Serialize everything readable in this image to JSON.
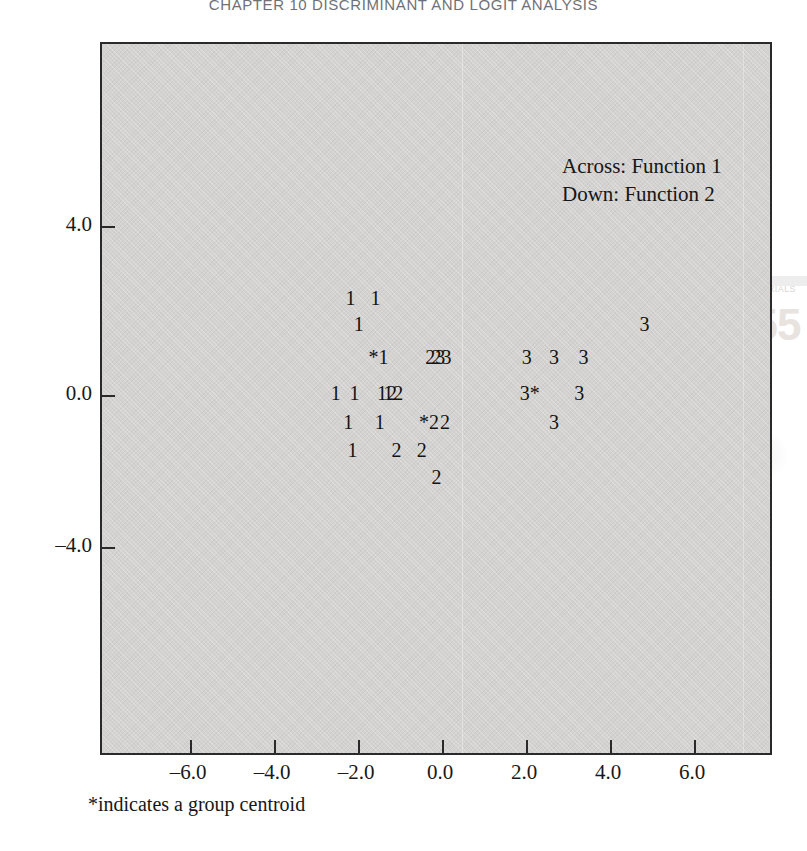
{
  "running_head": "CHAPTER 10     DISCRIMINANT AND LOGIT ANALYSIS",
  "ghost": {
    "word_a": "MATERIALS",
    "big": "255",
    "word_b": "chapter"
  },
  "legend": {
    "line1": "Across: Function 1",
    "line2": "Down: Function 2"
  },
  "footnote": "*indicates a group centroid",
  "axis": {
    "y_ticks": [
      "4.0",
      "0.0",
      "–4.0"
    ],
    "x_ticks": [
      "–6.0",
      "–4.0",
      "–2.0",
      "0.0",
      "2.0",
      "4.0",
      "6.0"
    ]
  },
  "chart_data": {
    "type": "scatter",
    "title": "",
    "subtitle": "",
    "xlabel": "Function 1",
    "ylabel": "Function 2",
    "xlim": [
      -7.6,
      7.6
    ],
    "ylim": [
      -7.0,
      9.0
    ],
    "grid": false,
    "legend_position": "inside-top-right",
    "annotations": [
      "Across: Function 1",
      "Down: Function 2",
      "*indicates a group centroid"
    ],
    "centroid_marker": "*",
    "series": [
      {
        "name": "Group 1",
        "marker": "1",
        "points": [
          {
            "label": "1",
            "x": -2.3,
            "y": 2.3
          },
          {
            "label": "1",
            "x": -1.7,
            "y": 2.3
          },
          {
            "label": "1",
            "x": -2.1,
            "y": 1.7
          },
          {
            "label": "*1",
            "x": -1.75,
            "y": 0.9
          },
          {
            "label": "1",
            "x": -2.65,
            "y": 0.05
          },
          {
            "label": "1",
            "x": -2.2,
            "y": 0.05
          },
          {
            "label": "12",
            "x": -1.55,
            "y": 0.05
          },
          {
            "label": "1",
            "x": -2.35,
            "y": -0.65
          },
          {
            "label": "1",
            "x": -1.6,
            "y": -0.65
          },
          {
            "label": "1",
            "x": -2.25,
            "y": -1.3
          }
        ]
      },
      {
        "name": "Group 2",
        "marker": "2",
        "points": [
          {
            "label": "23",
            "x": -0.4,
            "y": 0.9
          },
          {
            "label": "12",
            "x": -1.4,
            "y": 0.05
          },
          {
            "label": "*2",
            "x": -0.55,
            "y": -0.65
          },
          {
            "label": "2",
            "x": -0.05,
            "y": -0.65
          },
          {
            "label": "2",
            "x": -1.2,
            "y": -1.3
          },
          {
            "label": "2",
            "x": -0.6,
            "y": -1.3
          },
          {
            "label": "2",
            "x": -0.25,
            "y": -1.95
          }
        ]
      },
      {
        "name": "Group 3",
        "marker": "3",
        "points": [
          {
            "label": "3",
            "x": 4.7,
            "y": 1.7
          },
          {
            "label": "23",
            "x": -0.25,
            "y": 0.9
          },
          {
            "label": "3",
            "x": 1.9,
            "y": 0.9
          },
          {
            "label": "3",
            "x": 2.55,
            "y": 0.9
          },
          {
            "label": "3",
            "x": 3.25,
            "y": 0.9
          },
          {
            "label": "3*",
            "x": 1.85,
            "y": 0.05
          },
          {
            "label": "3",
            "x": 3.15,
            "y": 0.05
          },
          {
            "label": "3",
            "x": 2.55,
            "y": -0.65
          }
        ]
      }
    ]
  }
}
